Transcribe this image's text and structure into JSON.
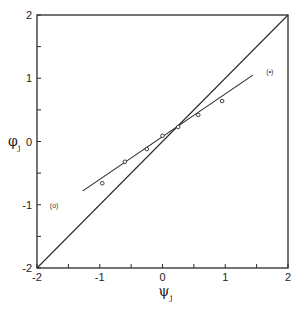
{
  "chart_data": {
    "type": "scatter",
    "title": "",
    "xlabel": "ψ_j",
    "ylabel": "φ_j",
    "xlim": [
      -2,
      2
    ],
    "ylim": [
      -2,
      2
    ],
    "grid": false,
    "x_ticks": [
      -2,
      -1.5,
      -1,
      -0.5,
      0,
      0.5,
      1,
      1.5,
      2
    ],
    "x_tick_labels": [
      "-2",
      "",
      "-1",
      "",
      "0",
      "",
      "1",
      "",
      "2"
    ],
    "y_ticks": [
      -2,
      -1.5,
      -1,
      -0.5,
      0,
      0.5,
      1,
      1.5,
      2
    ],
    "y_tick_labels": [
      "-2",
      "",
      "-1",
      "",
      "0",
      "",
      "1",
      "",
      "2"
    ],
    "series": [
      {
        "name": "data points",
        "marker": "open-circle",
        "x": [
          -0.96,
          -0.6,
          -0.25,
          0.0,
          0.25,
          0.57,
          0.95
        ],
        "y": [
          -0.66,
          -0.32,
          -0.12,
          0.09,
          0.23,
          0.42,
          0.64
        ]
      },
      {
        "name": "fitted line (o)",
        "type": "line",
        "x": [
          -1.27,
          1.44
        ],
        "y": [
          -0.78,
          1.05
        ]
      },
      {
        "name": "identity line (•)",
        "type": "line",
        "x": [
          -2,
          2
        ],
        "y": [
          -2,
          2
        ]
      }
    ],
    "annotations": [
      {
        "text": "(o)",
        "x": -1.7,
        "y": -1.0
      },
      {
        "text": "(•)",
        "x": 1.75,
        "y": 1.12
      }
    ]
  },
  "labels": {
    "x_axis_main": "ψ",
    "x_axis_sub": "j",
    "y_axis_main": "φ",
    "y_axis_sub": "j",
    "annot_open": "(o)",
    "annot_filled": "(•)"
  }
}
